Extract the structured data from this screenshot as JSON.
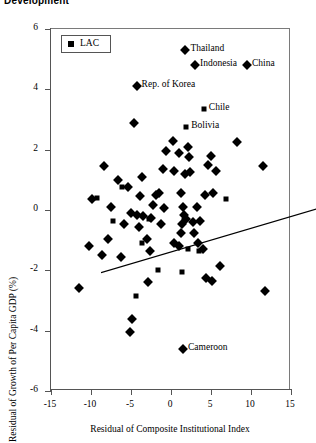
{
  "figure": {
    "title": "Development"
  },
  "legend": {
    "entries": [
      {
        "label": "LAC",
        "marker": "square"
      }
    ]
  },
  "axes": {
    "x": {
      "title": "Residual of Composite Institutional Index",
      "ticks": [
        -15,
        -10,
        -5,
        0,
        5,
        10,
        15
      ],
      "tick_labels": [
        "-15",
        "-10",
        "-5",
        "0",
        "5",
        "10",
        "15"
      ],
      "min": -15,
      "max": 15
    },
    "y": {
      "title": "Residual of Growth of Per Capita GDP (%)",
      "ticks": [
        -6,
        -4,
        -2,
        0,
        2,
        4,
        6
      ],
      "tick_labels": [
        "-6",
        "-4",
        "-2",
        "0",
        "2",
        "4",
        "6"
      ],
      "min": -6,
      "max": 6
    }
  },
  "chart_data": {
    "type": "scatter",
    "title": "Development",
    "xlabel": "Residual of Composite Institutional Index",
    "ylabel": "Residual of Growth of Per Capita GDP (%)",
    "xlim": [
      -15,
      15
    ],
    "ylim": [
      -6,
      6
    ],
    "grid": false,
    "legend_position": "top-left",
    "legend_entries": [
      "LAC"
    ],
    "series": [
      {
        "name": "Other economies",
        "marker": "diamond",
        "color": "#000000",
        "points": [
          {
            "x": 1.8,
            "y": 5.3,
            "label": "Thailand",
            "label_side": "right"
          },
          {
            "x": 3.0,
            "y": 4.8,
            "label": "Indonesia",
            "label_side": "right"
          },
          {
            "x": 9.5,
            "y": 4.8,
            "label": "China",
            "label_side": "right"
          },
          {
            "x": -4.3,
            "y": 4.1,
            "label": "Rep. of Korea",
            "label_side": "right"
          },
          {
            "x": 1.5,
            "y": -4.6,
            "label": "Cameroon",
            "label_side": "right"
          },
          {
            "x": -4.6,
            "y": 2.9
          },
          {
            "x": -8.4,
            "y": 1.45
          },
          {
            "x": -6.6,
            "y": 1.0
          },
          {
            "x": -9.9,
            "y": 0.35
          },
          {
            "x": -11.5,
            "y": -2.6
          },
          {
            "x": -7.5,
            "y": 0.1
          },
          {
            "x": -5.4,
            "y": 0.75
          },
          {
            "x": -3.6,
            "y": 1.1
          },
          {
            "x": -3.9,
            "y": 0.45
          },
          {
            "x": -5.0,
            "y": -0.1
          },
          {
            "x": -4.3,
            "y": -0.15
          },
          {
            "x": -3.5,
            "y": -0.2
          },
          {
            "x": -4.0,
            "y": -0.55
          },
          {
            "x": -5.9,
            "y": -0.45
          },
          {
            "x": -6.2,
            "y": -1.55
          },
          {
            "x": -4.9,
            "y": -3.6
          },
          {
            "x": -5.1,
            "y": -4.05
          },
          {
            "x": -3.0,
            "y": -0.95
          },
          {
            "x": -2.6,
            "y": -1.35
          },
          {
            "x": -2.9,
            "y": -2.4
          },
          {
            "x": -8.6,
            "y": -1.5
          },
          {
            "x": -0.6,
            "y": 1.95
          },
          {
            "x": -1.0,
            "y": 1.35
          },
          {
            "x": -1.5,
            "y": 0.55
          },
          {
            "x": -1.9,
            "y": 0.5
          },
          {
            "x": -0.9,
            "y": 0.05
          },
          {
            "x": -1.2,
            "y": -0.45
          },
          {
            "x": 0.2,
            "y": 2.3
          },
          {
            "x": 1.0,
            "y": 1.9
          },
          {
            "x": 0.4,
            "y": 1.3
          },
          {
            "x": 1.7,
            "y": 1.2
          },
          {
            "x": 2.4,
            "y": 1.25
          },
          {
            "x": 2.1,
            "y": 2.1
          },
          {
            "x": 2.3,
            "y": 1.75
          },
          {
            "x": 1.2,
            "y": 0.55
          },
          {
            "x": 1.5,
            "y": 0.1
          },
          {
            "x": 1.6,
            "y": -0.15
          },
          {
            "x": 1.9,
            "y": -0.3
          },
          {
            "x": 1.4,
            "y": -0.45
          },
          {
            "x": 1.3,
            "y": -0.75
          },
          {
            "x": 0.4,
            "y": -1.1
          },
          {
            "x": 1.0,
            "y": -1.2
          },
          {
            "x": 2.9,
            "y": -0.75
          },
          {
            "x": 3.4,
            "y": -1.1
          },
          {
            "x": 3.6,
            "y": -0.35
          },
          {
            "x": 4.0,
            "y": -1.3
          },
          {
            "x": 4.4,
            "y": -2.25
          },
          {
            "x": 5.1,
            "y": -2.35
          },
          {
            "x": 6.1,
            "y": -1.85
          },
          {
            "x": 4.2,
            "y": 0.5
          },
          {
            "x": 5.3,
            "y": 0.55
          },
          {
            "x": 5.6,
            "y": 1.3
          },
          {
            "x": 4.6,
            "y": 1.5
          },
          {
            "x": 5.0,
            "y": 1.8
          },
          {
            "x": 8.2,
            "y": 2.25
          },
          {
            "x": 11.5,
            "y": 1.45
          },
          {
            "x": 11.8,
            "y": -2.7
          },
          {
            "x": -10.3,
            "y": -1.2
          },
          {
            "x": -7.9,
            "y": -0.95
          },
          {
            "x": -2.2,
            "y": 0.15
          },
          {
            "x": -2.5,
            "y": -0.25
          },
          {
            "x": 3.2,
            "y": 0.1
          },
          {
            "x": 2.7,
            "y": -0.4
          }
        ]
      },
      {
        "name": "LAC",
        "marker": "square",
        "color": "#000000",
        "points": [
          {
            "x": 4.1,
            "y": 3.35,
            "label": "Chile",
            "label_side": "right"
          },
          {
            "x": 1.9,
            "y": 2.75,
            "label": "Bolivia",
            "label_side": "right"
          },
          {
            "x": -6.1,
            "y": 0.75
          },
          {
            "x": -7.3,
            "y": -0.35
          },
          {
            "x": -3.6,
            "y": -1.1
          },
          {
            "x": -2.8,
            "y": -0.3
          },
          {
            "x": -9.2,
            "y": 0.4
          },
          {
            "x": -1.6,
            "y": -2.0
          },
          {
            "x": 1.4,
            "y": -2.05
          },
          {
            "x": 2.1,
            "y": -1.3
          },
          {
            "x": 3.5,
            "y": -1.35
          },
          {
            "x": 6.9,
            "y": 0.35
          },
          {
            "x": -4.4,
            "y": -2.85
          }
        ]
      }
    ],
    "trendline": {
      "type": "linear",
      "x_start": -15,
      "y_start": -1.15,
      "x_end": 15,
      "y_end": 1.2
    }
  }
}
